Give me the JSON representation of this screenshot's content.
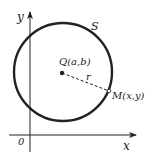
{
  "diagram": {
    "axes": {
      "x_label": "x",
      "y_label": "y",
      "origin_label": "0"
    },
    "circle": {
      "label": "S"
    },
    "center": {
      "label": "Q(a,b)"
    },
    "radius": {
      "label": "r"
    },
    "point": {
      "label": "M(x,y)"
    },
    "colors": {
      "ink": "#222222",
      "background": "#ffffff"
    }
  }
}
